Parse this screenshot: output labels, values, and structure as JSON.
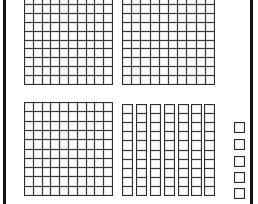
{
  "page": {
    "title": "Base Ten Blocks Place Value Model",
    "background_color": "#ffffff",
    "frame_color": "#141414",
    "grid_line_color": "#3a3a3a",
    "cell_fill_color": "#fdfdfd",
    "width": 258,
    "height": 204
  },
  "frame": {
    "left_rule_label": "left page rule",
    "right_rule_label": "right page rule"
  },
  "model": {
    "kind": "base-ten-blocks",
    "hundreds_count": 3,
    "tens_count": 7,
    "ones_count": 5,
    "total_value": 375,
    "hundreds_value": 300,
    "tens_value": 70,
    "ones_value": 5,
    "unit_cells_per_flat": 100,
    "unit_cells_per_rod": 10,
    "unit_cells_per_unit": 1,
    "total_unit_cells": 375
  },
  "blocks": [
    {
      "id": "flat-1",
      "name": "hundred-flat",
      "label": "Hundred flat 1",
      "value": 100,
      "rows": 10,
      "cols": 10,
      "x": 24,
      "y": -5,
      "w": 89,
      "h": 90
    },
    {
      "id": "flat-2",
      "name": "hundred-flat",
      "label": "Hundred flat 2",
      "value": 100,
      "rows": 10,
      "cols": 10,
      "x": 122,
      "y": -5,
      "w": 93,
      "h": 90
    },
    {
      "id": "flat-3",
      "name": "hundred-flat",
      "label": "Hundred flat 3",
      "value": 100,
      "rows": 10,
      "cols": 10,
      "x": 24,
      "y": 102,
      "w": 89,
      "h": 94
    },
    {
      "id": "rod-1",
      "name": "ten-rod",
      "label": "Ten rod 1",
      "value": 10,
      "rows": 10,
      "cols": 1,
      "x": 122,
      "y": 104,
      "w": 11,
      "h": 92
    },
    {
      "id": "rod-2",
      "name": "ten-rod",
      "label": "Ten rod 2",
      "value": 10,
      "rows": 10,
      "cols": 1,
      "x": 136,
      "y": 104,
      "w": 11,
      "h": 92
    },
    {
      "id": "rod-3",
      "name": "ten-rod",
      "label": "Ten rod 3",
      "value": 10,
      "rows": 10,
      "cols": 1,
      "x": 150,
      "y": 104,
      "w": 11,
      "h": 92
    },
    {
      "id": "rod-4",
      "name": "ten-rod",
      "label": "Ten rod 4",
      "value": 10,
      "rows": 10,
      "cols": 1,
      "x": 164,
      "y": 104,
      "w": 11,
      "h": 92
    },
    {
      "id": "rod-5",
      "name": "ten-rod",
      "label": "Ten rod 5",
      "value": 10,
      "rows": 10,
      "cols": 1,
      "x": 178,
      "y": 104,
      "w": 11,
      "h": 92
    },
    {
      "id": "rod-6",
      "name": "ten-rod",
      "label": "Ten rod 6",
      "value": 10,
      "rows": 10,
      "cols": 1,
      "x": 191,
      "y": 104,
      "w": 11,
      "h": 92
    },
    {
      "id": "rod-7",
      "name": "ten-rod",
      "label": "Ten rod 7",
      "value": 10,
      "rows": 10,
      "cols": 1,
      "x": 204,
      "y": 104,
      "w": 11,
      "h": 92
    },
    {
      "id": "unit-1",
      "name": "unit-cube",
      "label": "Unit cube 1",
      "value": 1,
      "rows": 1,
      "cols": 1,
      "x": 234,
      "y": 122,
      "w": 11,
      "h": 11
    },
    {
      "id": "unit-2",
      "name": "unit-cube",
      "label": "Unit cube 2",
      "value": 1,
      "rows": 1,
      "cols": 1,
      "x": 234,
      "y": 139,
      "w": 11,
      "h": 11
    },
    {
      "id": "unit-3",
      "name": "unit-cube",
      "label": "Unit cube 3",
      "value": 1,
      "rows": 1,
      "cols": 1,
      "x": 234,
      "y": 156,
      "w": 11,
      "h": 11
    },
    {
      "id": "unit-4",
      "name": "unit-cube",
      "label": "Unit cube 4",
      "value": 1,
      "rows": 1,
      "cols": 1,
      "x": 234,
      "y": 172,
      "w": 11,
      "h": 11
    },
    {
      "id": "unit-5",
      "name": "unit-cube",
      "label": "Unit cube 5",
      "value": 1,
      "rows": 1,
      "cols": 1,
      "x": 234,
      "y": 188,
      "w": 11,
      "h": 11
    }
  ]
}
